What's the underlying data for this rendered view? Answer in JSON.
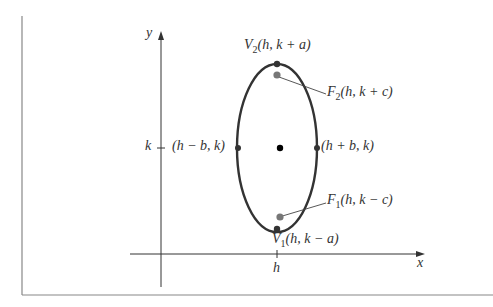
{
  "figure": {
    "type": "vertical ellipse with center (h, k)",
    "axes": {
      "x_label": "x",
      "y_label": "y",
      "x_tick": "h",
      "y_tick": "k"
    },
    "points": {
      "v2": {
        "name": "V",
        "sub": "2",
        "coords": "(h, k + a)"
      },
      "f2": {
        "name": "F",
        "sub": "2",
        "coords": "(h, k + c)"
      },
      "left": {
        "coords": "(h − b, k)"
      },
      "right": {
        "coords": "(h + b, k)"
      },
      "f1": {
        "name": "F",
        "sub": "1",
        "coords": "(h, k − c)"
      },
      "v1": {
        "name": "V",
        "sub": "1",
        "coords": "(h, k − a)"
      }
    },
    "colors": {
      "curve": "#333333",
      "focus": "#777777",
      "center": "#000000",
      "frame": "#777777"
    }
  }
}
